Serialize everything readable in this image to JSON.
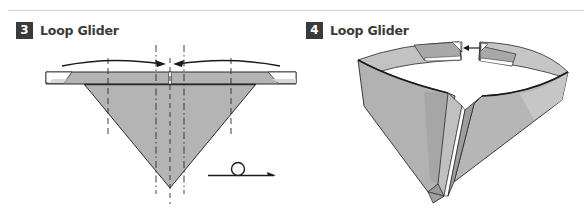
{
  "steps": [
    {
      "number": "3",
      "title": "Loop Glider"
    },
    {
      "number": "4",
      "title": "Loop Glider"
    }
  ],
  "colors": {
    "paper_fill": "#b4b4b4",
    "paper_light": "#cbcbcb",
    "paper_dark": "#9e9e9e",
    "outline": "#2a2a2a",
    "badge_bg": "#3a3a3a",
    "rule": "#d4d4d4"
  },
  "symbols": {
    "step3_arrows": "curved-arrows-toward-center",
    "step3_fold_lines": "dash-dot-valley-mountain-lines",
    "step3_action": "loop-arrow-turn-over",
    "step4_arrow": "arrow-tuck-end-into-slot"
  }
}
